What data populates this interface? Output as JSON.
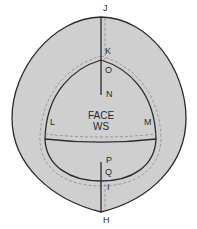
{
  "diagram": {
    "colors": {
      "fill": "#cfcfcf",
      "stroke": "#2a2a2a",
      "dashed": "#8a8a8a",
      "background": "#ffffff"
    },
    "center_text": {
      "line1": "FACE",
      "line2": "WS"
    },
    "points": {
      "J": "J",
      "K": "K",
      "O": "O",
      "N": "N",
      "L": "L",
      "M": "M",
      "P": "P",
      "Q": "Q",
      "I": "I",
      "H": "H"
    }
  }
}
